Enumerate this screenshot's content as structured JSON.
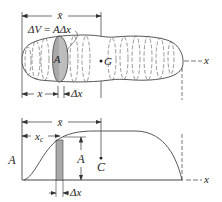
{
  "top_figure": {
    "name": "volume-body",
    "xbar_label": "x̄",
    "dv_label_lhs": "ΔV",
    "dv_label_eq": " = ",
    "dv_label_rhs_A": "A",
    "dv_label_rhs_dx": "Δx",
    "slice_area_label": "A",
    "centroid_label": "G",
    "x_dim_label": "x",
    "dx_dim_label": "Δx",
    "axis_label": "x",
    "slice_color": "#a9a9a9"
  },
  "bottom_figure": {
    "name": "area-distribution-curve",
    "xbar_label": "x̄",
    "xc_label_main": "x",
    "xc_label_sub": "c",
    "y_axis_label": "A",
    "bar_height_label": "A",
    "centroid_label": "C",
    "dx_dim_label": "Δx",
    "axis_label": "x",
    "bar_color": "#a9a9a9"
  }
}
